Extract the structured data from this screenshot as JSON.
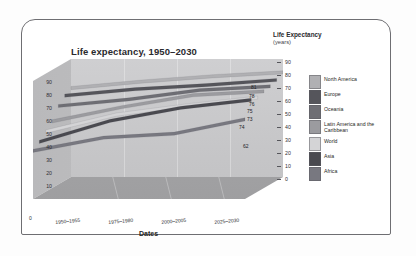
{
  "chart_data": {
    "type": "area",
    "title": "Life expectancy, 1950–2030",
    "xlabel": "Dates",
    "ylabel": "Life Expectancy",
    "ylabel_unit": "(years)",
    "categories": [
      "1950–1955",
      "1975–1980",
      "2000–2005",
      "2025–2030"
    ],
    "ylim": [
      0,
      90
    ],
    "yticks": [
      "90",
      "80",
      "70",
      "60",
      "50",
      "40",
      "30",
      "20",
      "10",
      "0"
    ],
    "left_axis_ticks": [
      "90",
      "80",
      "70",
      "60",
      "50",
      "40",
      "30",
      "20",
      "10",
      "0"
    ],
    "right_axis_ticks": [
      "90",
      "80",
      "70",
      "60",
      "50",
      "40",
      "30",
      "20",
      "10",
      "0"
    ],
    "grid": true,
    "legend_position": "right",
    "series": [
      {
        "name": "North America",
        "color": "#b0b0b3",
        "values": [
          69,
          74,
          78,
          81
        ],
        "end_label": "81"
      },
      {
        "name": "Europe",
        "color": "#55555b",
        "values": [
          66,
          71,
          74,
          78
        ],
        "end_label": "78"
      },
      {
        "name": "Oceania",
        "color": "#6e6e74",
        "values": [
          61,
          66,
          73,
          76
        ],
        "end_label": "76"
      },
      {
        "name": "Latin America and the Caribbean",
        "color": "#9b9b9f",
        "values": [
          52,
          63,
          72,
          75
        ],
        "end_label": "75"
      },
      {
        "name": "World",
        "color": "#d4d4d6",
        "values": [
          47,
          60,
          67,
          73
        ],
        "end_label": "73"
      },
      {
        "name": "Asia",
        "color": "#4a4a50",
        "values": [
          42,
          58,
          68,
          74
        ],
        "end_label": "74"
      },
      {
        "name": "Africa",
        "color": "#787880",
        "values": [
          38,
          48,
          51,
          62
        ],
        "end_label": "62"
      }
    ]
  },
  "chart": {
    "title": "Life expectancy, 1950–2030",
    "right_axis_title": "Life Expectancy",
    "right_axis_subtitle": "(years)",
    "x_axis_title": "Dates",
    "zero_corner": "0"
  },
  "legend": {
    "items": [
      {
        "label": "North America",
        "color": "#b0b0b3"
      },
      {
        "label": "Europe",
        "color": "#55555b"
      },
      {
        "label": "Oceania",
        "color": "#6e6e74"
      },
      {
        "label": "Latin America and the Caribbean",
        "color": "#9b9b9f"
      },
      {
        "label": "World",
        "color": "#d4d4d6"
      },
      {
        "label": "Asia",
        "color": "#4a4a50"
      },
      {
        "label": "Africa",
        "color": "#787880"
      }
    ]
  }
}
